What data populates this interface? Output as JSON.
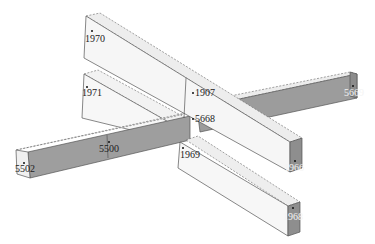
{
  "diagram": {
    "type": "3d-beam-grid-model",
    "colors": {
      "beam_top": "#f5f5f5",
      "beam_side_light": "#ebebeb",
      "beam_side_dark": "#9a9a9a",
      "beam_end": "#8c8c8c",
      "background": "#ffffff"
    },
    "nodes": [
      {
        "id": "n1970",
        "label": "1970"
      },
      {
        "id": "n1971",
        "label": "1971"
      },
      {
        "id": "n1907",
        "label": "1907"
      },
      {
        "id": "n5669",
        "label": "5669"
      },
      {
        "id": "n5668",
        "label": "5668"
      },
      {
        "id": "n5500",
        "label": "5500"
      },
      {
        "id": "n1969",
        "label": "1969"
      },
      {
        "id": "n5502",
        "label": "5502"
      },
      {
        "id": "n1966",
        "label": "1966"
      },
      {
        "id": "n1968",
        "label": "1968"
      }
    ]
  }
}
